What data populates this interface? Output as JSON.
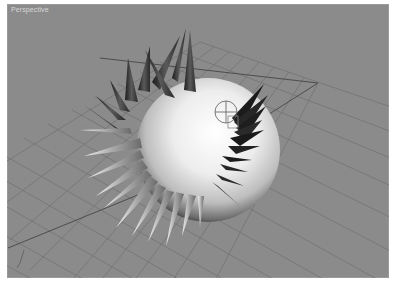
{
  "viewport": {
    "label": "Perspective",
    "background_color": "#8b8b8b",
    "grid_color": "#777777",
    "grid_axis_color": "#4a4a4a"
  },
  "scene": {
    "objects": [
      {
        "name": "sphere",
        "type": "sphere-with-spikes",
        "color": "#e8e8e8"
      },
      {
        "name": "transform-gizmo",
        "type": "rotate-gizmo"
      }
    ]
  },
  "axis_tripod": {
    "label": ""
  }
}
